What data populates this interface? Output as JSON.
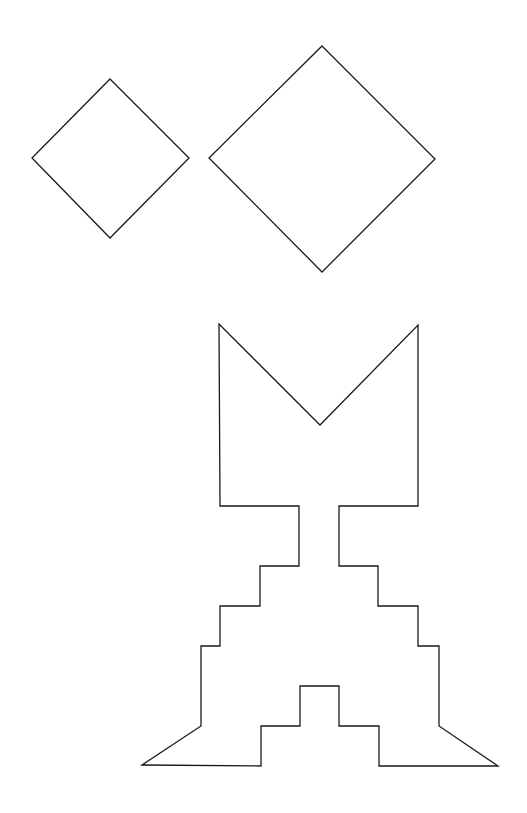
{
  "canvas": {
    "width": 527,
    "height": 813,
    "background": "#ffffff",
    "stroke": "#1a1a1a"
  },
  "shapes": {
    "small_square": {
      "label": "small diamond",
      "points": "110,79 189,158 110,238 32,158"
    },
    "large_square": {
      "label": "large diamond",
      "points": "322,46 435,159 322,272 209,158"
    },
    "silhouette": {
      "label": "tangram silhouette figure",
      "points": "219,324 320,425 418,325 418,506 339,506 339,566 378,566 378,606 418,606 418,646 439,646 439,726 498,766 379,766 379,726 339,726 339,686 300,686 300,726 261,726 261,766 142,765 201,726 201,646 220,646 220,606 260,606 260,566 299,566 299,506 220,506"
    }
  }
}
